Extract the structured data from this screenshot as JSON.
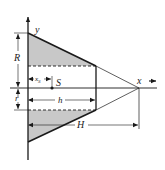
{
  "diagram": {
    "colors": {
      "line": "#1a1a1a",
      "shade": "#c8c8c8",
      "background": "#ffffff"
    },
    "labels": {
      "y_axis": "y",
      "x_axis": "x",
      "R": "R",
      "r": "r",
      "xs": "x",
      "xs_sub": "S",
      "S": "S",
      "h": "h",
      "H": "H"
    }
  }
}
